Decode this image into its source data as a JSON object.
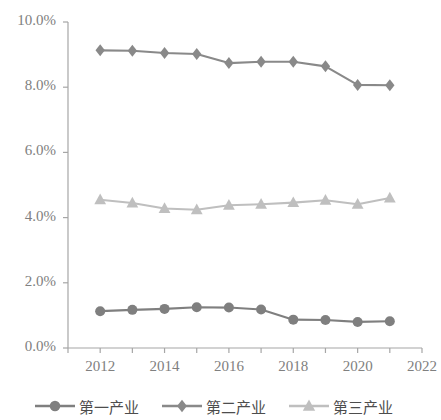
{
  "chart_data": {
    "type": "line",
    "title": "",
    "xlabel": "",
    "ylabel": "",
    "x": [
      2012,
      2013,
      2014,
      2015,
      2016,
      2017,
      2018,
      2019,
      2020,
      2021
    ],
    "xlim": [
      2011,
      2022
    ],
    "ylim": [
      0.0,
      10.0
    ],
    "y_tick_labels": [
      "0.0%",
      "2.0%",
      "4.0%",
      "6.0%",
      "8.0%",
      "10.0%"
    ],
    "y_tick_values": [
      0.0,
      2.0,
      4.0,
      6.0,
      8.0,
      10.0
    ],
    "x_tick_labels": [
      "2012",
      "2014",
      "2016",
      "2018",
      "2020",
      "2022"
    ],
    "x_tick_values": [
      2012,
      2014,
      2016,
      2018,
      2020,
      2022
    ],
    "x_minor_ticks": [
      2011,
      2012,
      2013,
      2014,
      2015,
      2016,
      2017,
      2018,
      2019,
      2020,
      2021,
      2022
    ],
    "grid": false,
    "legend_position": "bottom",
    "series": [
      {
        "name": "第一产业",
        "marker": "circle",
        "color": "#7f7f7f",
        "values": [
          1.13,
          1.17,
          1.2,
          1.25,
          1.24,
          1.18,
          0.87,
          0.86,
          0.8,
          0.82
        ]
      },
      {
        "name": "第二产业",
        "marker": "diamond",
        "color": "#898989",
        "values": [
          9.13,
          9.12,
          9.05,
          9.02,
          8.74,
          8.78,
          8.78,
          8.64,
          8.07,
          8.06
        ]
      },
      {
        "name": "第三产业",
        "marker": "triangle",
        "color": "#bfbfbf",
        "values": [
          4.55,
          4.45,
          4.28,
          4.24,
          4.38,
          4.41,
          4.46,
          4.53,
          4.41,
          4.6
        ]
      }
    ]
  },
  "axis": {
    "line_color": "#a6a6a6",
    "tick_color": "#a6a6a6",
    "label_color": "#808080"
  }
}
